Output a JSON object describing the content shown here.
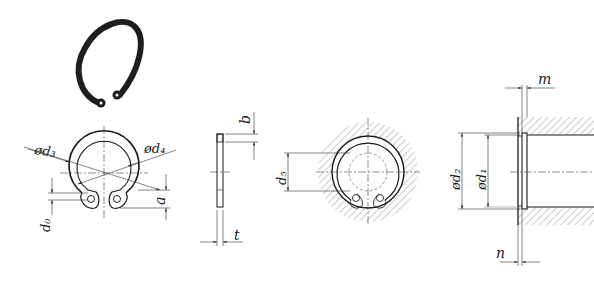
{
  "diagram": {
    "views": {
      "isometric": {
        "description": "3D view of retaining ring"
      },
      "front": {
        "labels": {
          "d3": "ød₃",
          "d4": "ød₄",
          "d0": "d₀",
          "a": "a"
        }
      },
      "side": {
        "labels": {
          "b": "b",
          "t": "t"
        }
      },
      "installed": {
        "labels": {
          "d5": "d₅"
        }
      },
      "groove_section": {
        "labels": {
          "m": "m",
          "d2": "ød₂",
          "d1": "ød₁",
          "n": "n"
        }
      }
    },
    "colors": {
      "line": "#222222",
      "ring": "#1a1a1a",
      "background": "#ffffff"
    }
  }
}
